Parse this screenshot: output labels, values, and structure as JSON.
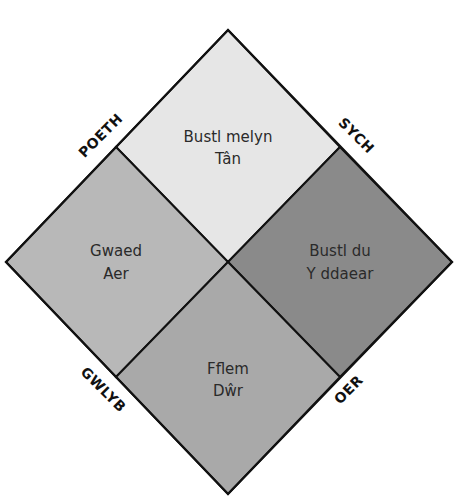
{
  "diagram": {
    "type": "four-humours-diamond",
    "colors": {
      "outline": "#111111",
      "top": "#e6e6e6",
      "left": "#b8b8b8",
      "right": "#8a8a8a",
      "bottom": "#a9a9a9",
      "background": "#ffffff"
    },
    "quadrants": {
      "top": {
        "humour": "Bustl melyn",
        "element": "Tân"
      },
      "left": {
        "humour": "Gwaed",
        "element": "Aer"
      },
      "right": {
        "humour": "Bustl du",
        "element": "Y ddaear"
      },
      "bottom": {
        "humour": "Fflem",
        "element": "Dŵr"
      }
    },
    "edge_labels": {
      "top_left": "POETH",
      "top_right": "SYCH",
      "bottom_left": "GWLYB",
      "bottom_right": "OER"
    }
  }
}
